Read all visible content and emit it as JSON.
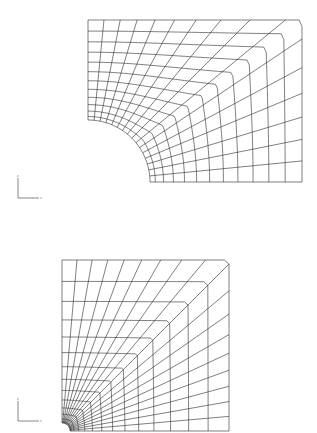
{
  "figure": {
    "background": "#ffffff",
    "line_color": "#2a2a2a",
    "panels": [
      {
        "name": "coarse-hole-mesh",
        "description": "Quarter plate with circular hole, radial-circumferential mesh",
        "origin": [
          88,
          182
        ],
        "hole_radius": 62,
        "outer_top": 20,
        "outer_right": 302,
        "radial_lines": 16,
        "ring_count": 12
      },
      {
        "name": "fine-hole-mesh",
        "description": "Quarter plate with small hole, graded square mesh",
        "origin": [
          62,
          431
        ],
        "hole_radius": 8,
        "outer_top": 260,
        "outer_right": 229,
        "radial_lines": 18,
        "ring_count": 14
      }
    ],
    "triads": [
      {
        "name": "axis-triad-top",
        "x": 18,
        "y": 198,
        "label_y": "z",
        "label_x": "x"
      },
      {
        "name": "axis-triad-bottom",
        "x": 18,
        "y": 421,
        "label_y": "z",
        "label_x": "x"
      }
    ]
  }
}
